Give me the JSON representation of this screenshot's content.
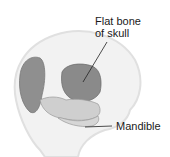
{
  "figure": {
    "labels": {
      "flat_bone_line1": "Flat bone",
      "flat_bone_line2": "of skull",
      "mandible": "Mandible"
    },
    "colors": {
      "head_outline": "#e6e6e6",
      "head_fill": "#f2f2f2",
      "bone_dark": "#8a8a8a",
      "bone_light": "#c8c8c8",
      "leader_line": "#222222"
    }
  }
}
